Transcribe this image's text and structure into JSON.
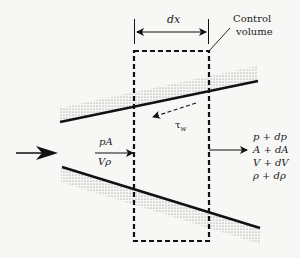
{
  "diagram": {
    "labels": {
      "dx": "dx",
      "control_volume_line1": "Control",
      "control_volume_line2": "volume",
      "inlet_top": "pA",
      "inlet_bottom": "Vρ",
      "wall_shear": "τ",
      "wall_shear_sub": "w",
      "outlet": [
        "p + dp",
        "A + dA",
        "V + dV",
        "ρ + dρ"
      ]
    },
    "colors": {
      "line": "#111111",
      "stipple": "#8a8a8a",
      "background": "#f7f7f5",
      "text": "#222222"
    }
  }
}
